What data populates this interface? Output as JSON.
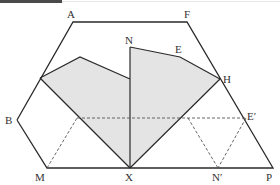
{
  "figure": {
    "type": "geometry-folding-diagram",
    "colors": {
      "line": "#2a2a2a",
      "shade": "#e4e4e4",
      "dashed": "#555555",
      "header": "#4a4a4a"
    },
    "labels": {
      "A": "A",
      "F": "F",
      "E": "E",
      "N": "N",
      "H": "H",
      "B": "B",
      "E_prime": "E′",
      "M": "M",
      "X": "X",
      "N_prime": "N′",
      "P": "P"
    }
  }
}
